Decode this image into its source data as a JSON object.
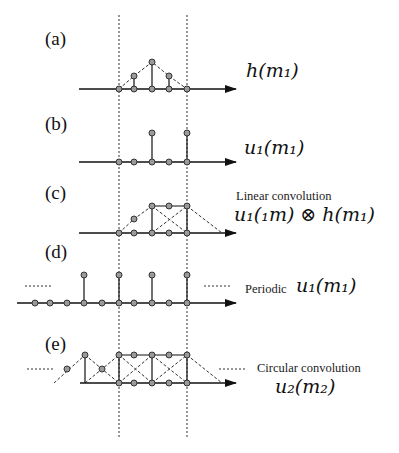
{
  "diagram": {
    "guides": {
      "x": [
        119,
        187
      ],
      "y_top": 15,
      "y_bottom": 437
    },
    "panels": [
      {
        "id": "a",
        "label": "(a)",
        "math": "h(m",
        "math_sub": "1",
        "math_close": ")",
        "caption": ""
      },
      {
        "id": "b",
        "label": "(b)",
        "math": "u",
        "math_sub": "1",
        "math_rest": "(m",
        "math_sub2": "1",
        "math_close": ")",
        "caption": ""
      },
      {
        "id": "c",
        "label": "(c)",
        "caption": "Linear convolution",
        "math_text": "u₁(₁m) ⊗ h(m₁)"
      },
      {
        "id": "d",
        "label": "(d)",
        "caption": "Periodic",
        "math_text": "u₁(m₁)"
      },
      {
        "id": "e",
        "label": "(e)",
        "caption": "Circular convolution",
        "math_text": "u₂(m₂)"
      }
    ]
  },
  "labels": {
    "a": "(a)",
    "b": "(b)",
    "c": "(c)",
    "d": "(d)",
    "e": "(e)",
    "a_math": "h(m₁)",
    "b_math": "u₁(m₁)",
    "c_caption": "Linear convolution",
    "c_math": "u₁(₁m) ⊗ h(m₁)",
    "d_caption": "Periodic",
    "d_math": "u₁(m₁)",
    "e_caption": "Circular convolution",
    "e_math": "u₂(m₂)"
  },
  "colors": {
    "line": "#111111",
    "dot_fill": "#9a9a9a",
    "dot_stroke": "#333333",
    "dashed": "#333333"
  }
}
